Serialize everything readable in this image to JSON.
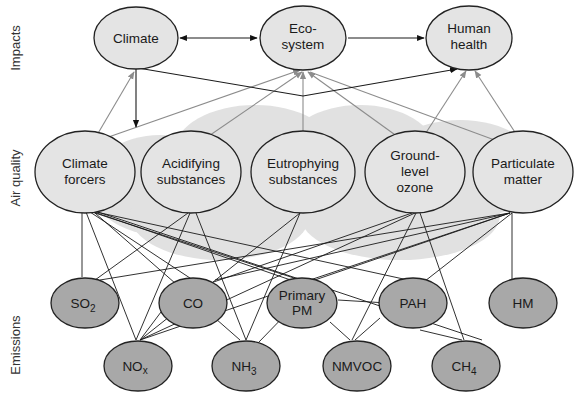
{
  "row_labels": {
    "impacts": "Impacts",
    "air_quality": "Air quality",
    "emissions": "Emissions"
  },
  "impacts": [
    {
      "id": "climate",
      "lines": [
        "Climate"
      ]
    },
    {
      "id": "ecosystem",
      "lines": [
        "Eco-",
        "system"
      ]
    },
    {
      "id": "human_health",
      "lines": [
        "Human",
        "health"
      ]
    }
  ],
  "air_quality": [
    {
      "id": "climate_forcers",
      "lines": [
        "Climate",
        "forcers"
      ]
    },
    {
      "id": "acidifying",
      "lines": [
        "Acidifying",
        "substances"
      ]
    },
    {
      "id": "eutrophying",
      "lines": [
        "Eutrophying",
        "substances"
      ]
    },
    {
      "id": "ozone",
      "lines": [
        "Ground-",
        "level",
        "ozone"
      ]
    },
    {
      "id": "pm",
      "lines": [
        "Particulate",
        "matter"
      ]
    }
  ],
  "emissions": [
    {
      "id": "so2",
      "label": "SO",
      "sub": "2"
    },
    {
      "id": "co",
      "label": "CO",
      "sub": ""
    },
    {
      "id": "primary_pm",
      "label": "Primary PM",
      "lines": [
        "Primary",
        "PM"
      ]
    },
    {
      "id": "pah",
      "label": "PAH",
      "sub": ""
    },
    {
      "id": "hm",
      "label": "HM",
      "sub": ""
    },
    {
      "id": "nox",
      "label": "NO",
      "sub": "x"
    },
    {
      "id": "nh3",
      "label": "NH",
      "sub": "3"
    },
    {
      "id": "nmvoc",
      "label": "NMVOC",
      "sub": ""
    },
    {
      "id": "ch4",
      "label": "CH",
      "sub": "4"
    }
  ],
  "colors": {
    "impact_fill": "#e4e4e4",
    "air_fill": "#e4e4e4",
    "emission_fill": "#a8a8a8",
    "cloud": "#d9d9d9",
    "edge_dark": "#1a1a1a",
    "edge_gray": "#8c8c8c"
  }
}
